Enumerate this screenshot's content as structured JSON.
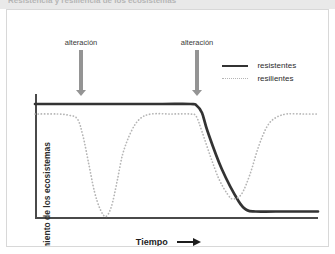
{
  "figure": {
    "title_fragment": "Resistencia y resiliencia de los ecosistemas"
  },
  "chart_data": {
    "type": "line",
    "title": "",
    "xlabel": "Tiempo",
    "ylabel": "Funcionamiento de los ecosistemas",
    "xlim": [
      0,
      100
    ],
    "ylim": [
      0,
      100
    ],
    "grid": false,
    "xticks": [],
    "yticks": [],
    "legend_position": "top-right",
    "annotations": [
      {
        "label": "alteración",
        "x": 15,
        "type": "down-arrow"
      },
      {
        "label": "alteración",
        "x": 57,
        "type": "down-arrow"
      }
    ],
    "series": [
      {
        "name": "resistentes",
        "style": "solid",
        "color": "#333333",
        "points": [
          [
            0,
            92
          ],
          [
            10,
            92
          ],
          [
            15,
            92
          ],
          [
            30,
            92
          ],
          [
            45,
            92
          ],
          [
            55,
            92
          ],
          [
            57,
            91
          ],
          [
            59,
            85
          ],
          [
            61,
            70
          ],
          [
            66,
            40
          ],
          [
            72,
            14
          ],
          [
            75,
            7
          ],
          [
            78,
            6
          ],
          [
            85,
            6
          ],
          [
            100,
            6
          ]
        ]
      },
      {
        "name": "resilientes",
        "style": "dotted",
        "color": "#b5b5b5",
        "points": [
          [
            0,
            84
          ],
          [
            8,
            84
          ],
          [
            12,
            83
          ],
          [
            15,
            80
          ],
          [
            17,
            66
          ],
          [
            19,
            44
          ],
          [
            21,
            22
          ],
          [
            23,
            8
          ],
          [
            25,
            2
          ],
          [
            27,
            10
          ],
          [
            29,
            30
          ],
          [
            31,
            52
          ],
          [
            34,
            70
          ],
          [
            37,
            80
          ],
          [
            41,
            84
          ],
          [
            48,
            84
          ],
          [
            55,
            84
          ],
          [
            57,
            82
          ],
          [
            59,
            70
          ],
          [
            62,
            50
          ],
          [
            65,
            32
          ],
          [
            68,
            20
          ],
          [
            70,
            16
          ],
          [
            73,
            20
          ],
          [
            76,
            36
          ],
          [
            79,
            58
          ],
          [
            82,
            74
          ],
          [
            85,
            81
          ],
          [
            89,
            84
          ],
          [
            95,
            84
          ],
          [
            100,
            84
          ]
        ]
      }
    ]
  },
  "legend": {
    "items": [
      {
        "label": "resistentes",
        "style": "solid"
      },
      {
        "label": "resilientes",
        "style": "dotted"
      }
    ]
  },
  "axes": {
    "x_title": "Tiempo",
    "y_title": "Funcionamiento de los ecosistemas"
  }
}
